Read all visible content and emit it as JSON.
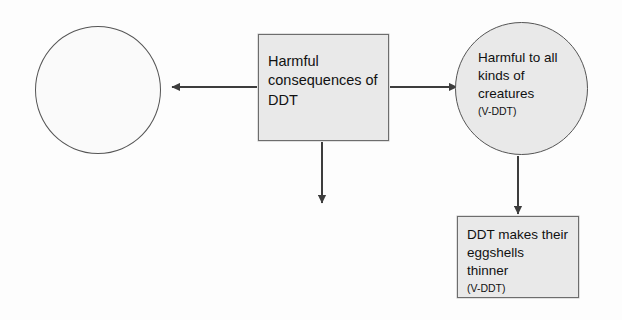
{
  "diagram": {
    "type": "concept-map",
    "background_color": "#fdfdfd",
    "node_fill_color": "#e9e9e9",
    "node_border_color": "#6d6d6d",
    "connector_color": "#3d3d3d",
    "nodes": [
      {
        "id": "left-circle",
        "shape": "ellipse",
        "label": "",
        "sub_label": ""
      },
      {
        "id": "center-box",
        "shape": "rectangle",
        "label": "Harmful consequences of DDT",
        "sub_label": ""
      },
      {
        "id": "right-circle",
        "shape": "ellipse",
        "label": "Harmful to all kinds of creatures",
        "sub_label": "(V-DDT)"
      },
      {
        "id": "bottom-box",
        "shape": "rectangle",
        "label": "DDT makes their eggshells thinner",
        "sub_label": "(V-DDT)"
      }
    ],
    "connectors": [
      {
        "id": "center-to-left",
        "from": "center-box",
        "to": "left-circle",
        "direction": "left",
        "arrowhead": "filled-triangle"
      },
      {
        "id": "center-to-right",
        "from": "center-box",
        "to": "right-circle",
        "direction": "right",
        "arrowhead": "filled-triangle"
      },
      {
        "id": "center-to-below",
        "from": "center-box",
        "to": "",
        "direction": "down",
        "arrowhead": "filled-triangle"
      },
      {
        "id": "right-circle-to-bottom-box",
        "from": "right-circle",
        "to": "bottom-box",
        "direction": "down",
        "arrowhead": "filled-triangle"
      }
    ]
  }
}
